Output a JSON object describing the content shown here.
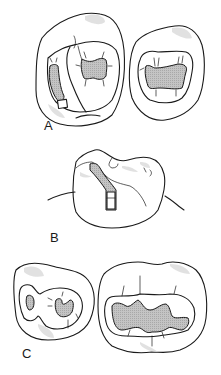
{
  "figure": {
    "panels": [
      {
        "id": "A",
        "label": "A",
        "description": "Occlusal view of two teeth with conservative preparations; left tooth shows a facial/lingual groove extension preparation"
      },
      {
        "id": "B",
        "label": "B",
        "description": "Proximal perspective view of a molar with a groove preparation on the facial surface"
      },
      {
        "id": "C",
        "label": "C",
        "description": "Occlusal view of premolar with two-part preparation and molar with extended occlusal preparation"
      }
    ],
    "colors": {
      "line": "#1a1a1a",
      "preparation_fill": "#b8b8b8",
      "shade": "#d9d9d9",
      "background": "#ffffff"
    }
  }
}
